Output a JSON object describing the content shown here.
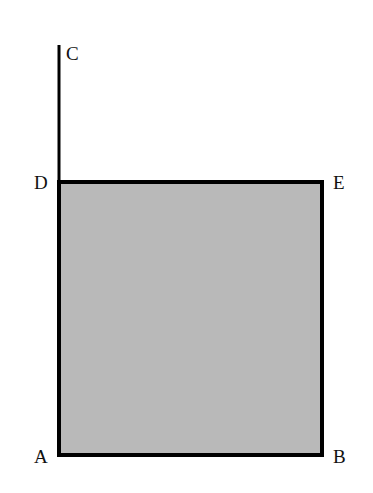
{
  "diagram": {
    "type": "geometry-figure",
    "fill_color": "#b9b9b9",
    "stroke_color": "#000000",
    "points": {
      "A": {
        "label": "A",
        "x": 59,
        "y": 455
      },
      "B": {
        "label": "B",
        "x": 322,
        "y": 455
      },
      "C": {
        "label": "C",
        "x": 59,
        "y": 45
      },
      "D": {
        "label": "D",
        "x": 59,
        "y": 182
      },
      "E": {
        "label": "E",
        "x": 322,
        "y": 182
      }
    },
    "segments": [
      "AB",
      "BE",
      "ED",
      "DA",
      "DC"
    ],
    "shaded_region": "ADEB"
  }
}
